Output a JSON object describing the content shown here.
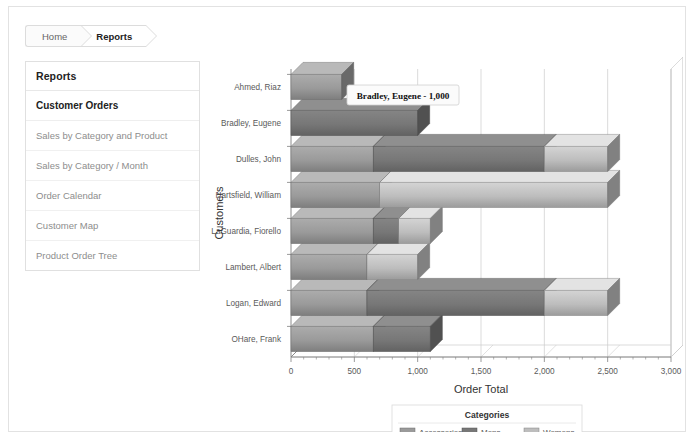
{
  "breadcrumb": {
    "items": [
      {
        "label": "Home",
        "active": false
      },
      {
        "label": "Reports",
        "active": true
      }
    ]
  },
  "sidebar": {
    "title": "Reports",
    "section": "Customer Orders",
    "items": [
      {
        "label": "Sales by Category and Product"
      },
      {
        "label": "Sales by Category / Month"
      },
      {
        "label": "Order Calendar"
      },
      {
        "label": "Customer Map"
      },
      {
        "label": "Product Order Tree"
      }
    ]
  },
  "tooltip": {
    "text": "Bradley, Eugene - 1,000"
  },
  "colors": {
    "accessories": "#9a9a9a",
    "mens": "#777777",
    "womens": "#bdbdbd",
    "axis": "#808080",
    "grid": "#cccccc",
    "panel_border": "#e0e0e0"
  },
  "chart_data": {
    "type": "bar",
    "orientation": "horizontal",
    "stacked": true,
    "title": "",
    "xlabel": "Order Total",
    "ylabel": "Customers",
    "xlim": [
      0,
      3000
    ],
    "xticks": [
      0,
      500,
      1000,
      1500,
      2000,
      2500,
      3000
    ],
    "xtick_labels": [
      "0",
      "500",
      "1,000",
      "1,500",
      "2,000",
      "2,500",
      "3,000"
    ],
    "grid": true,
    "legend": {
      "title": "Categories",
      "position": "bottom",
      "entries": [
        "Accessories",
        "Mens",
        "Womens"
      ]
    },
    "categories": [
      "Ahmed, Riaz",
      "Bradley, Eugene",
      "Dulles, John",
      "Hartsfield, William",
      "LaGuardia, Fiorello",
      "Lambert, Albert",
      "Logan, Edward",
      "OHare, Frank"
    ],
    "series": [
      {
        "name": "Accessories",
        "values": [
          400,
          0,
          650,
          700,
          650,
          600,
          600,
          650
        ]
      },
      {
        "name": "Mens",
        "values": [
          0,
          1000,
          1350,
          0,
          200,
          0,
          1400,
          450
        ]
      },
      {
        "name": "Womens",
        "values": [
          0,
          0,
          500,
          1800,
          250,
          400,
          500,
          0
        ]
      }
    ],
    "totals": [
      400,
      1000,
      2500,
      2500,
      1100,
      1000,
      2500,
      1100
    ],
    "highlight": {
      "category": "Bradley, Eugene",
      "value": 1000
    }
  }
}
